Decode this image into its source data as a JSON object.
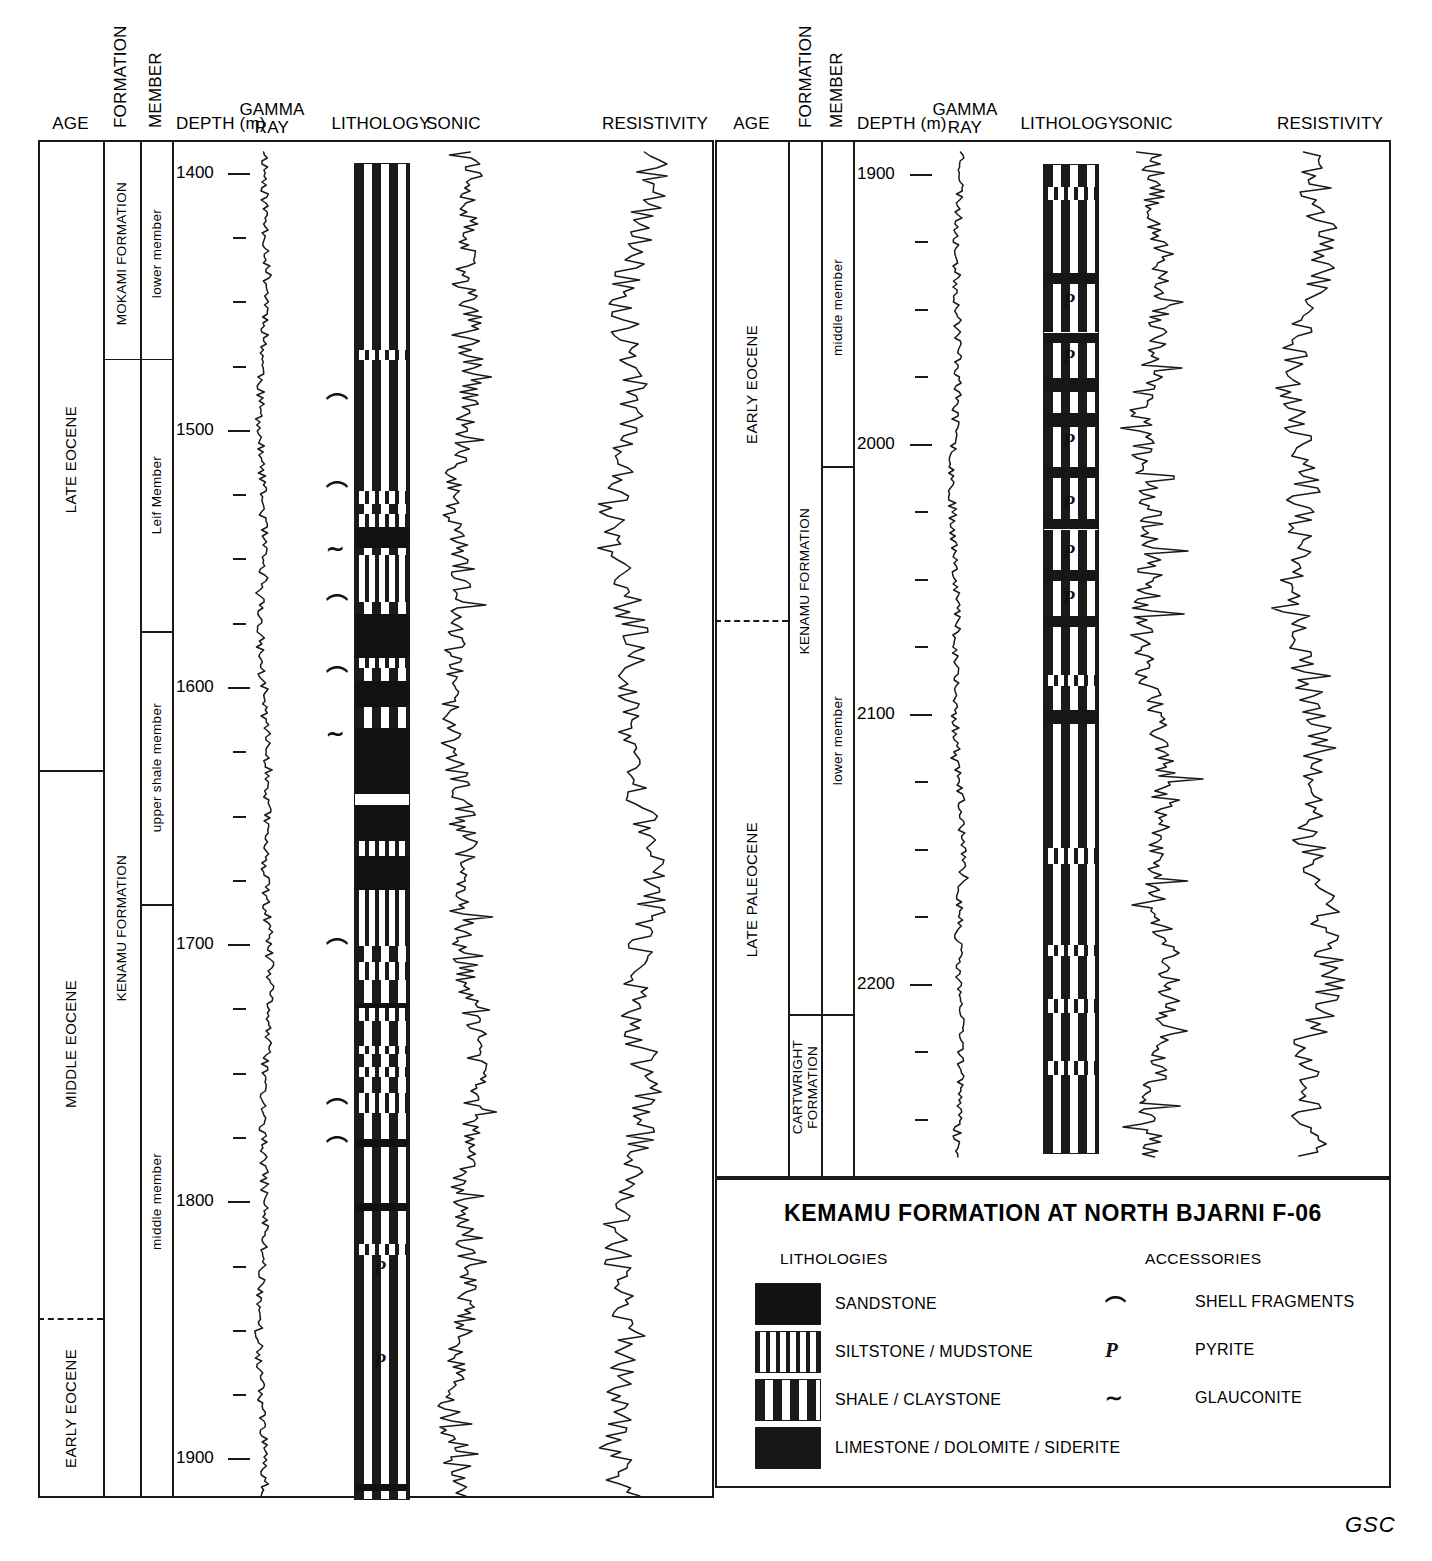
{
  "figure": {
    "credit": "GSC",
    "width": 1432,
    "height": 1561
  },
  "columns_headers": {
    "age": "AGE",
    "formation": "FORMATION",
    "member": "MEMBER",
    "depth": "DEPTH (m)",
    "gamma_ray_line1": "GAMMA",
    "gamma_ray_line2": "RAY",
    "lithology": "LITHOLOGY",
    "sonic": "SONIC",
    "resistivity": "RESISTIVITY"
  },
  "panels": [
    {
      "id": "left",
      "depth_range": [
        1390,
        1915
      ],
      "depth_labels": [
        "1400",
        "1500",
        "1600",
        "1700",
        "1800",
        "1900"
      ],
      "depth_label_values": [
        1400,
        1500,
        1600,
        1700,
        1800,
        1900
      ],
      "minor_tick_interval": 25,
      "age_units": [
        {
          "label": "LATE EOCENE",
          "top": 1390,
          "bottom": 1632,
          "boundary": "solid"
        },
        {
          "label": "MIDDLE EOCENE",
          "top": 1632,
          "bottom": 1845,
          "boundary": "dashed"
        },
        {
          "label": "EARLY EOCENE",
          "top": 1845,
          "bottom": 1915,
          "boundary": "none"
        }
      ],
      "formation_units": [
        {
          "label": "MOKAMI FORMATION",
          "top": 1390,
          "bottom": 1472
        },
        {
          "label": "KENAMU FORMATION",
          "top": 1472,
          "bottom": 1915
        }
      ],
      "member_units": [
        {
          "label": "lower member",
          "top": 1390,
          "bottom": 1472
        },
        {
          "label": "Leif Member",
          "top": 1472,
          "bottom": 1578
        },
        {
          "label": "upper shale member",
          "top": 1578,
          "bottom": 1684
        },
        {
          "label": "middle member",
          "top": 1684,
          "bottom": 1915
        }
      ]
    },
    {
      "id": "right",
      "depth_range": [
        1890,
        2265
      ],
      "depth_labels": [
        "1900",
        "2000",
        "2100",
        "2200"
      ],
      "depth_label_values": [
        1900,
        2000,
        2100,
        2200
      ],
      "minor_tick_interval": 25,
      "age_units": [
        {
          "label": "EARLY EOCENE",
          "top": 1890,
          "bottom": 2065,
          "boundary": "dashed"
        },
        {
          "label": "LATE PALEOCENE",
          "top": 2065,
          "bottom": 2265,
          "boundary": "none"
        }
      ],
      "formation_units": [
        {
          "label": "KENAMU FORMATION",
          "top": 1890,
          "bottom": 2211
        },
        {
          "label": "CARTWRIGHT FORMATION",
          "top": 2211,
          "bottom": 2265
        }
      ],
      "member_units": [
        {
          "label": "middle member",
          "top": 1890,
          "bottom": 2008
        },
        {
          "label": "lower member",
          "top": 2008,
          "bottom": 2211
        },
        {
          "label": "",
          "top": 2211,
          "bottom": 2265
        }
      ]
    }
  ],
  "lithology_legend": {
    "title": "KEMAMU FORMATION AT NORTH BJARNI F-06",
    "lithologies_heading": "LITHOLOGIES",
    "accessories_heading": "ACCESSORIES",
    "lithologies": [
      {
        "pattern": "sandstone",
        "label": "SANDSTONE"
      },
      {
        "pattern": "siltstone",
        "label": "SILTSTONE / MUDSTONE"
      },
      {
        "pattern": "shale",
        "label": "SHALE / CLAYSTONE"
      },
      {
        "pattern": "limestone",
        "label": "LIMESTONE / DOLOMITE / SIDERITE"
      }
    ],
    "accessories": [
      {
        "symbol": "⌒",
        "name": "shell-fragments-icon",
        "label": "SHELL FRAGMENTS"
      },
      {
        "symbol": "P",
        "name": "pyrite-icon",
        "label": "PYRITE"
      },
      {
        "symbol": "∼",
        "name": "glauconite-icon",
        "label": "GLAUCONITE"
      }
    ]
  },
  "chart_data": {
    "type": "table",
    "title": "KEMAMU FORMATION AT NORTH BJARNI F-06",
    "ylabel": "DEPTH (m)",
    "tracks": [
      "GAMMA RAY",
      "LITHOLOGY",
      "SONIC",
      "RESISTIVITY"
    ],
    "left_panel": {
      "depth_top": 1390,
      "depth_bottom": 1915,
      "lithology_beds": [
        {
          "top": 1396,
          "bottom": 1468,
          "type": "shale"
        },
        {
          "top": 1468,
          "bottom": 1472,
          "type": "silt"
        },
        {
          "top": 1472,
          "bottom": 1523,
          "type": "shale"
        },
        {
          "top": 1523,
          "bottom": 1528,
          "type": "silt"
        },
        {
          "top": 1528,
          "bottom": 1532,
          "type": "shale"
        },
        {
          "top": 1532,
          "bottom": 1537,
          "type": "silt"
        },
        {
          "top": 1537,
          "bottom": 1545,
          "type": "sand"
        },
        {
          "top": 1545,
          "bottom": 1548,
          "type": "shale"
        },
        {
          "top": 1548,
          "bottom": 1566,
          "type": "silt"
        },
        {
          "top": 1566,
          "bottom": 1571,
          "type": "shale"
        },
        {
          "top": 1571,
          "bottom": 1588,
          "type": "sand"
        },
        {
          "top": 1588,
          "bottom": 1592,
          "type": "silt"
        },
        {
          "top": 1592,
          "bottom": 1597,
          "type": "shale"
        },
        {
          "top": 1597,
          "bottom": 1607,
          "type": "sand"
        },
        {
          "top": 1607,
          "bottom": 1615,
          "type": "shale"
        },
        {
          "top": 1615,
          "bottom": 1641,
          "type": "sand"
        },
        {
          "top": 1641,
          "bottom": 1645,
          "type": "blank"
        },
        {
          "top": 1645,
          "bottom": 1659,
          "type": "sand"
        },
        {
          "top": 1659,
          "bottom": 1665,
          "type": "silt"
        },
        {
          "top": 1665,
          "bottom": 1678,
          "type": "sand"
        },
        {
          "top": 1678,
          "bottom": 1700,
          "type": "silt"
        },
        {
          "top": 1700,
          "bottom": 1706,
          "type": "shale"
        },
        {
          "top": 1706,
          "bottom": 1713,
          "type": "silt"
        },
        {
          "top": 1713,
          "bottom": 1722,
          "type": "shale"
        },
        {
          "top": 1722,
          "bottom": 1724,
          "type": "sand"
        },
        {
          "top": 1724,
          "bottom": 1729,
          "type": "silt"
        },
        {
          "top": 1729,
          "bottom": 1739,
          "type": "shale"
        },
        {
          "top": 1739,
          "bottom": 1742,
          "type": "silt"
        },
        {
          "top": 1742,
          "bottom": 1747,
          "type": "shale"
        },
        {
          "top": 1747,
          "bottom": 1751,
          "type": "silt"
        },
        {
          "top": 1751,
          "bottom": 1757,
          "type": "shale"
        },
        {
          "top": 1757,
          "bottom": 1765,
          "type": "silt"
        },
        {
          "top": 1765,
          "bottom": 1775,
          "type": "shale"
        },
        {
          "top": 1775,
          "bottom": 1778,
          "type": "sand"
        },
        {
          "top": 1778,
          "bottom": 1800,
          "type": "shale"
        },
        {
          "top": 1800,
          "bottom": 1803,
          "type": "sand"
        },
        {
          "top": 1803,
          "bottom": 1816,
          "type": "shale"
        },
        {
          "top": 1816,
          "bottom": 1820,
          "type": "silt"
        },
        {
          "top": 1820,
          "bottom": 1909,
          "type": "shale"
        },
        {
          "top": 1909,
          "bottom": 1912,
          "type": "sand"
        },
        {
          "top": 1912,
          "bottom": 1915,
          "type": "shale"
        }
      ],
      "accessories": [
        {
          "depth": 1490,
          "symbol": "shell"
        },
        {
          "depth": 1524,
          "symbol": "shell"
        },
        {
          "depth": 1546,
          "symbol": "glauconite"
        },
        {
          "depth": 1568,
          "symbol": "shell"
        },
        {
          "depth": 1596,
          "symbol": "shell"
        },
        {
          "depth": 1618,
          "symbol": "glauconite"
        },
        {
          "depth": 1702,
          "symbol": "shell"
        },
        {
          "depth": 1764,
          "symbol": "shell"
        },
        {
          "depth": 1779,
          "symbol": "shell"
        },
        {
          "depth": 1826,
          "symbol": "pyrite"
        },
        {
          "depth": 1862,
          "symbol": "pyrite"
        }
      ]
    },
    "right_panel": {
      "depth_top": 1890,
      "depth_bottom": 2265,
      "lithology_beds": [
        {
          "top": 1896,
          "bottom": 1904,
          "type": "shale"
        },
        {
          "top": 1904,
          "bottom": 1909,
          "type": "silt"
        },
        {
          "top": 1909,
          "bottom": 1936,
          "type": "shale"
        },
        {
          "top": 1936,
          "bottom": 1940,
          "type": "lime"
        },
        {
          "top": 1940,
          "bottom": 1958,
          "type": "shale"
        },
        {
          "top": 1958,
          "bottom": 1962,
          "type": "lime"
        },
        {
          "top": 1962,
          "bottom": 1975,
          "type": "shale"
        },
        {
          "top": 1975,
          "bottom": 1980,
          "type": "lime"
        },
        {
          "top": 1980,
          "bottom": 1988,
          "type": "shale"
        },
        {
          "top": 1988,
          "bottom": 1993,
          "type": "lime"
        },
        {
          "top": 1993,
          "bottom": 2008,
          "type": "shale"
        },
        {
          "top": 2008,
          "bottom": 2012,
          "type": "lime"
        },
        {
          "top": 2012,
          "bottom": 2027,
          "type": "shale"
        },
        {
          "top": 2027,
          "bottom": 2031,
          "type": "lime"
        },
        {
          "top": 2031,
          "bottom": 2046,
          "type": "shale"
        },
        {
          "top": 2046,
          "bottom": 2050,
          "type": "lime"
        },
        {
          "top": 2050,
          "bottom": 2063,
          "type": "shale"
        },
        {
          "top": 2063,
          "bottom": 2067,
          "type": "lime"
        },
        {
          "top": 2067,
          "bottom": 2085,
          "type": "shale"
        },
        {
          "top": 2085,
          "bottom": 2089,
          "type": "silt"
        },
        {
          "top": 2089,
          "bottom": 2098,
          "type": "shale"
        },
        {
          "top": 2098,
          "bottom": 2103,
          "type": "lime"
        },
        {
          "top": 2103,
          "bottom": 2149,
          "type": "shale"
        },
        {
          "top": 2149,
          "bottom": 2155,
          "type": "silt"
        },
        {
          "top": 2155,
          "bottom": 2185,
          "type": "shale"
        },
        {
          "top": 2185,
          "bottom": 2189,
          "type": "silt"
        },
        {
          "top": 2189,
          "bottom": 2205,
          "type": "shale"
        },
        {
          "top": 2205,
          "bottom": 2210,
          "type": "silt"
        },
        {
          "top": 2210,
          "bottom": 2228,
          "type": "shale"
        },
        {
          "top": 2228,
          "bottom": 2233,
          "type": "silt"
        },
        {
          "top": 2233,
          "bottom": 2262,
          "type": "shale"
        }
      ],
      "accessories": [
        {
          "depth": 1947,
          "symbol": "pyrite"
        },
        {
          "depth": 1968,
          "symbol": "pyrite"
        },
        {
          "depth": 1999,
          "symbol": "pyrite"
        },
        {
          "depth": 2022,
          "symbol": "pyrite"
        },
        {
          "depth": 2040,
          "symbol": "pyrite"
        },
        {
          "depth": 2057,
          "symbol": "pyrite"
        }
      ]
    }
  }
}
